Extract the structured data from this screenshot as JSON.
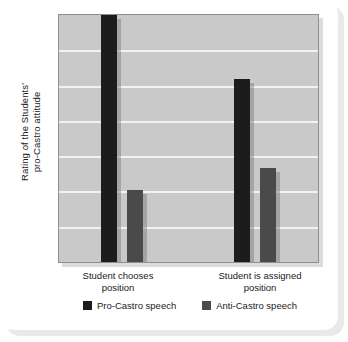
{
  "chart_data": {
    "type": "bar",
    "title": "",
    "subtitle": "",
    "xlabel": "",
    "ylabel": "Rating of the Students' pro-Castro attitude",
    "ylabel_lines": [
      "Rating of the Students'",
      "pro-Castro attitude"
    ],
    "categories": [
      "Student chooses position",
      "Student is assigned position"
    ],
    "category_lines": [
      [
        "Student chooses",
        "position"
      ],
      [
        "Student is assigned",
        "position"
      ]
    ],
    "series": [
      {
        "name": "Pro-Castro speech",
        "color": "#1c1c1c",
        "values": [
          100,
          74
        ]
      },
      {
        "name": "Anti-Castro speech",
        "color": "#4a4a4a",
        "values": [
          29,
          38
        ]
      }
    ],
    "ylim": [
      0,
      100
    ],
    "y_tick_labels": [],
    "gridlines": 6,
    "grid": true,
    "grid_color": "#f2f2f2",
    "legend_position": "bottom",
    "plot_background": "#c9c9c9",
    "card_background": "#ffffff"
  },
  "legend": {
    "items": [
      {
        "label": "Pro-Castro speech",
        "color": "#1c1c1c"
      },
      {
        "label": "Anti-Castro speech",
        "color": "#4a4a4a"
      }
    ]
  }
}
